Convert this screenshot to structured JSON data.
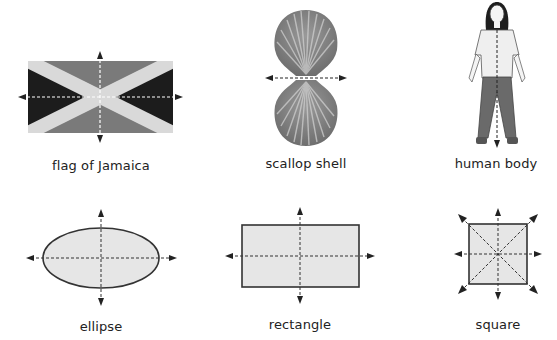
{
  "figure": {
    "items": [
      {
        "id": "flag",
        "label": "flag of Jamaica",
        "axes": [
          "horizontal",
          "vertical"
        ]
      },
      {
        "id": "shell",
        "label": "scallop shell",
        "axes": [
          "horizontal"
        ]
      },
      {
        "id": "human",
        "label": "human body",
        "axes": [
          "vertical"
        ]
      },
      {
        "id": "ellipse",
        "label": "ellipse",
        "axes": [
          "horizontal",
          "vertical"
        ]
      },
      {
        "id": "rectangle",
        "label": "rectangle",
        "axes": [
          "horizontal",
          "vertical"
        ]
      },
      {
        "id": "square",
        "label": "square",
        "axes": [
          "horizontal",
          "vertical",
          "diagonal",
          "anti-diagonal"
        ]
      }
    ]
  },
  "colors": {
    "flag_dark": "#1c1c1c",
    "flag_mid": "#7a7a7a",
    "flag_saltire": "#d9d9d9",
    "shape_fill": "#e6e6e6",
    "shape_stroke": "#333333",
    "axis_line": "#333333"
  }
}
